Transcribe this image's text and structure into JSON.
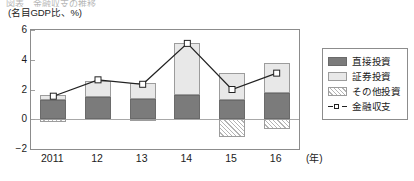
{
  "header": {
    "clipped_title": "図表　金融収支の推移",
    "unit_label": "(名目GDP比、%)"
  },
  "axis": {
    "x_unit": "(年)",
    "y_ticks": [
      "6",
      "4",
      "2",
      "0",
      "-2"
    ],
    "x_ticks": [
      "2011",
      "12",
      "13",
      "14",
      "15",
      "16"
    ]
  },
  "legend": {
    "items": [
      {
        "label": "直接投資",
        "swatch": "solid-dark-gray",
        "color": "#7b7b7b"
      },
      {
        "label": "証券投資",
        "swatch": "solid-light-gray",
        "color": "#e8e8e8"
      },
      {
        "label": "その他投資",
        "swatch": "diagonal-hatch",
        "color": "#ffffff"
      },
      {
        "label": "金融収支",
        "swatch": "line-with-square-marker",
        "color": "#222222"
      }
    ]
  },
  "chart_data": {
    "type": "bar",
    "subtype": "stacked-bar-with-overlay-line",
    "title": "",
    "xlabel": "(年)",
    "ylabel": "(名目GDP比、%)",
    "ylim": [
      -2,
      6
    ],
    "ytick_values": [
      6,
      4,
      2,
      0,
      -2
    ],
    "grid": false,
    "zero_line": true,
    "legend_position": "right",
    "categories": [
      "2011",
      "12",
      "13",
      "14",
      "15",
      "16"
    ],
    "series": [
      {
        "name": "直接投資",
        "type": "bar",
        "stack": "positive",
        "values": [
          1.3,
          1.5,
          1.35,
          1.65,
          1.3,
          1.75
        ]
      },
      {
        "name": "証券投資",
        "type": "bar",
        "stack": "positive",
        "values": [
          0.35,
          1.1,
          1.1,
          3.45,
          1.8,
          2.0
        ]
      },
      {
        "name": "その他投資",
        "type": "bar",
        "stack": "negative",
        "values": [
          -0.2,
          0.0,
          -0.15,
          0.0,
          -1.2,
          -0.65
        ]
      },
      {
        "name": "金融収支",
        "type": "line",
        "values": [
          1.55,
          2.65,
          2.35,
          5.1,
          2.0,
          3.1
        ]
      }
    ],
    "bar_tops": [
      1.65,
      2.6,
      2.45,
      5.1,
      3.1,
      3.75
    ],
    "bar_bottoms": [
      -0.2,
      0.0,
      -0.15,
      0.0,
      -1.2,
      -0.65
    ]
  }
}
